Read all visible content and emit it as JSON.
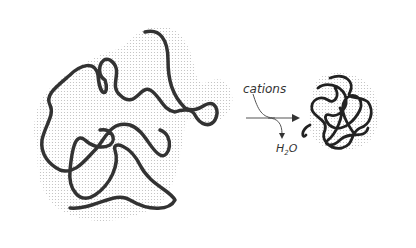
{
  "diagram": {
    "reactant": {
      "label": "",
      "description": "extended hydrated polymer chain with water shell"
    },
    "arrow": {
      "input_label": "cations",
      "output_label_main": "H",
      "output_label_sub": "2",
      "output_label_tail": "O"
    },
    "product": {
      "description": "collapsed compact polymer coil"
    },
    "colors": {
      "chain": "#333333",
      "shell": "#c8c8c8",
      "arrow": "#555555"
    }
  }
}
